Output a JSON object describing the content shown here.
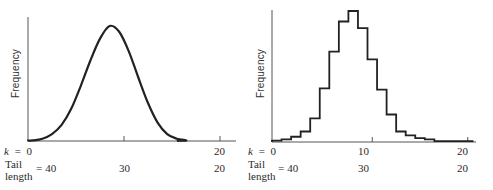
{
  "chart_data": [
    {
      "type": "line",
      "title": "",
      "panel": "left",
      "description": "Smooth bell-shaped frequency curve (continuous approximation)",
      "ylabel": "Frequency",
      "xlabel_rows": [
        {
          "name": "k",
          "ticks": [
            {
              "pos": 0,
              "label": "0"
            },
            {
              "pos": 10,
              "label": ""
            },
            {
              "pos": 20,
              "label": "20"
            }
          ]
        },
        {
          "name": "Tail length",
          "ticks": [
            {
              "pos": 0,
              "label": "40"
            },
            {
              "pos": 10,
              "label": "30"
            },
            {
              "pos": 20,
              "label": "20"
            }
          ]
        }
      ],
      "x": [
        0,
        1,
        2,
        3,
        4,
        5,
        6,
        7,
        8,
        9,
        10,
        11,
        12,
        13,
        14,
        15,
        16
      ],
      "values": [
        0.5,
        2,
        6,
        14,
        28,
        48,
        70,
        89,
        100,
        95,
        78,
        55,
        33,
        16,
        6,
        2,
        0.5
      ],
      "xlim": [
        0,
        22
      ],
      "ylim": [
        0,
        105
      ],
      "grid": false
    },
    {
      "type": "bar",
      "style": "step-histogram",
      "title": "",
      "panel": "right",
      "ylabel": "Frequency",
      "xlabel_rows": [
        {
          "name": "k",
          "ticks": [
            {
              "pos": 0,
              "label": "0"
            },
            {
              "pos": 10,
              "label": "10"
            },
            {
              "pos": 20,
              "label": "20"
            }
          ]
        },
        {
          "name": "Tail length",
          "ticks": [
            {
              "pos": 0,
              "label": "40"
            },
            {
              "pos": 10,
              "label": "30"
            },
            {
              "pos": 20,
              "label": "20"
            }
          ]
        }
      ],
      "categories": [
        0,
        1,
        2,
        3,
        4,
        5,
        6,
        7,
        8,
        9,
        10,
        11,
        12,
        13,
        14,
        15,
        16,
        17,
        18,
        19,
        20
      ],
      "values": [
        1,
        2,
        4,
        8,
        18,
        41,
        69,
        92,
        100,
        87,
        63,
        40,
        21,
        8,
        5,
        3,
        2,
        0,
        0,
        0,
        0
      ],
      "xlim": [
        0,
        22
      ],
      "ylim": [
        0,
        105
      ],
      "grid": false
    }
  ],
  "labels": {
    "ylabel": "Frequency",
    "k_prefix": "k",
    "equals": "=",
    "tail_line1": "Tail",
    "tail_line2": "length"
  }
}
